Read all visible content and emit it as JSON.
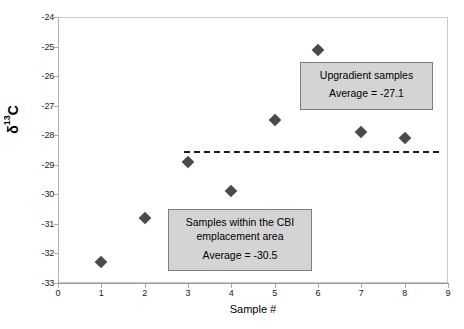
{
  "chart_data": {
    "type": "scatter",
    "title": "",
    "xlabel": "Sample #",
    "ylabel": "δ13C",
    "xlim": [
      0,
      9
    ],
    "ylim": [
      -33,
      -24
    ],
    "grid": false,
    "legend_position": "none",
    "x": [
      1,
      2,
      3,
      4,
      5,
      6,
      7,
      8
    ],
    "values": [
      -32.3,
      -30.8,
      -28.9,
      -29.9,
      -27.5,
      -25.1,
      -27.9,
      -28.1
    ],
    "series": [
      {
        "name": "δ13C",
        "marker": "diamond",
        "color": "#4a4a4a",
        "points": [
          {
            "x": 1,
            "y": -32.3
          },
          {
            "x": 2,
            "y": -30.8
          },
          {
            "x": 3,
            "y": -28.9
          },
          {
            "x": 4,
            "y": -29.9
          },
          {
            "x": 5,
            "y": -27.5
          },
          {
            "x": 6,
            "y": -25.1
          },
          {
            "x": 7,
            "y": -27.9
          },
          {
            "x": 8,
            "y": -28.1
          }
        ]
      }
    ],
    "reference_line": {
      "style": "dashed",
      "color": "#1a1a1a",
      "y": -28.55,
      "x_start": 2.9,
      "x_end": 8.8
    },
    "xticks": [
      "0",
      "1",
      "2",
      "3",
      "4",
      "5",
      "6",
      "7",
      "8",
      "9"
    ],
    "xtick_values": [
      0,
      1,
      2,
      3,
      4,
      5,
      6,
      7,
      8,
      9
    ],
    "yticks": [
      "-24",
      "-25",
      "-26",
      "-27",
      "-28",
      "-29",
      "-30",
      "-31",
      "-32",
      "-33"
    ],
    "ytick_values": [
      -24,
      -25,
      -26,
      -27,
      -28,
      -29,
      -30,
      -31,
      -32,
      -33
    ],
    "annotations": [
      {
        "id": "upgradient",
        "line1": "Upgradient samples",
        "line2": "Average = -27.1",
        "average": -27.1
      },
      {
        "id": "cbi-emplacement",
        "line1": "Samples within the CBI",
        "line2": "emplacement area",
        "line3": "Average = -30.5",
        "average": -30.5
      }
    ]
  },
  "axes": {
    "ylabel_delta": "δ",
    "ylabel_sup": "13",
    "ylabel_tail": "C",
    "xlabel": "Sample #"
  },
  "colors": {
    "marker": "#4a4a4a",
    "callout_fill": "#d4d4d4",
    "callout_border": "#7d7d7d",
    "axis": "#b0b0b0",
    "text": "#000000"
  }
}
